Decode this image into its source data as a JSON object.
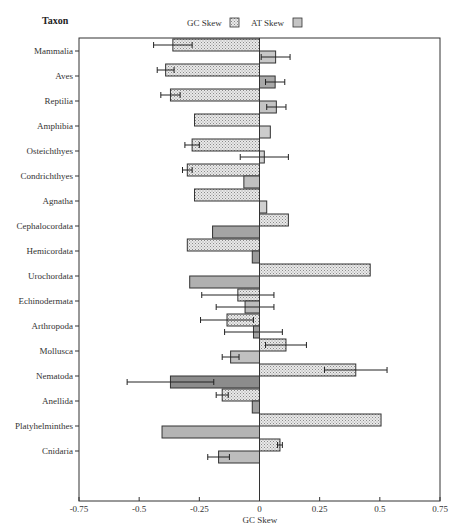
{
  "chart_data": {
    "type": "bar",
    "orientation": "horizontal",
    "title": "",
    "yaxis_title": "Taxon",
    "xlabel": "GC Skew",
    "ylabel": "Taxon",
    "xlim": [
      -0.75,
      0.75
    ],
    "xticks": [
      -0.75,
      -0.5,
      -0.25,
      0,
      0.25,
      0.5,
      0.75
    ],
    "xtick_labels": [
      "-0.75",
      "-0.5",
      "-0.25",
      "0",
      "0.25",
      "0.5",
      "0.75"
    ],
    "grid": false,
    "legend_position": "top",
    "legend": [
      "GC Skew",
      "AT Skew"
    ],
    "categories": [
      "Mammalia",
      "Aves",
      "Reptilia",
      "Amphibia",
      "Osteichthyes",
      "Condrichthyes",
      "Agnatha",
      "Cephalocordata",
      "Hemicordata",
      "Urochordata",
      "Echinodermata",
      "Arthropoda",
      "Mollusca",
      "Nematoda",
      "Anellida",
      "Platyhelminthes",
      "Cnidaria"
    ],
    "series": [
      {
        "name": "GC Skew",
        "pattern": "dotted",
        "values": [
          -0.36,
          -0.39,
          -0.37,
          -0.27,
          -0.28,
          -0.3,
          -0.27,
          0.12,
          -0.3,
          0.46,
          -0.09,
          -0.135,
          0.11,
          0.4,
          -0.155,
          0.505,
          0.085
        ],
        "errors": [
          0.08,
          0.035,
          0.04,
          0,
          0.03,
          0.02,
          0,
          0,
          0,
          0,
          0.15,
          0.11,
          0.085,
          0.13,
          0.025,
          0,
          0.01
        ]
      },
      {
        "name": "AT Skew",
        "pattern": "gray",
        "values": [
          0.067,
          0.065,
          0.07,
          0.045,
          0.02,
          -0.065,
          0.03,
          -0.195,
          -0.03,
          -0.29,
          -0.06,
          -0.025,
          -0.12,
          -0.37,
          -0.03,
          -0.405,
          -0.17
        ],
        "errors": [
          0.06,
          0.04,
          0.04,
          0,
          0.1,
          0,
          0,
          0,
          0,
          0,
          0.12,
          0.12,
          0.035,
          0.18,
          0,
          0,
          0.045
        ],
        "shades": [
          "#c8c8c8",
          "#a8a8a8",
          "#c4c4c4",
          "#cccccc",
          "#d2d2d2",
          "#c0c0c0",
          "#d0d0d0",
          "#a4a4a4",
          "#9a9a9a",
          "#b0b0b0",
          "#bcbcbc",
          "#a0a0a0",
          "#c0c0c0",
          "#8c8c8c",
          "#a0a0a0",
          "#b4b4b4",
          "#bdbdbd"
        ]
      }
    ]
  },
  "colors": {
    "gc_fill": "#e6e6e6",
    "gc_dot": "#8a8a8a",
    "at_fill": "#c0c0c0",
    "stroke": "#333333",
    "axis": "#333333"
  },
  "layout": {
    "plot_left": 79,
    "plot_right": 440,
    "plot_top": 38,
    "plot_bottom": 501,
    "first_tick_y": 51,
    "row_step": 25.0,
    "bar_height": 12
  }
}
